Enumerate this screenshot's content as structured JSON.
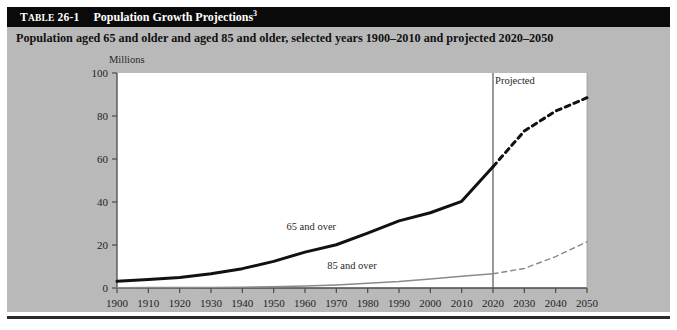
{
  "table": {
    "label_prefix": "T",
    "label_smallcaps": "ABLE",
    "label_number": " 26-1",
    "title": "Population Growth Projections",
    "title_footnote": "3",
    "subtitle": "Population aged 65 and older and aged 85 and older, selected years 1900–2010 and projected 2020–2050"
  },
  "chart_data": {
    "type": "line",
    "title": "Population Growth Projections",
    "subtitle": "Population aged 65 and older and aged 85 and older, selected years 1900–2010 and projected 2020–2050",
    "xlabel": "",
    "ylabel": "Millions",
    "y_unit_label": "Millions",
    "xlim": [
      1900,
      2050
    ],
    "ylim": [
      0,
      100
    ],
    "yticks": [
      0,
      20,
      40,
      60,
      80,
      100
    ],
    "xticks": [
      1900,
      1910,
      1920,
      1930,
      1940,
      1950,
      1960,
      1970,
      1980,
      1990,
      2000,
      2010,
      2020,
      2030,
      2040,
      2050
    ],
    "grid": false,
    "legend_position": "inline-annotations",
    "projection_divider_x": 2020,
    "projection_label": "Projected",
    "annotations": [
      {
        "text": "65 and over",
        "x": 1962,
        "y": 27
      },
      {
        "text": "85 and over",
        "x": 1975,
        "y": 9
      },
      {
        "text": "Projected",
        "x": 2027,
        "y": 95
      }
    ],
    "x": [
      1900,
      1910,
      1920,
      1930,
      1940,
      1950,
      1960,
      1970,
      1980,
      1990,
      2000,
      2010,
      2020,
      2030,
      2040,
      2050
    ],
    "series": [
      {
        "name": "65 and over",
        "style": "thick-black",
        "color": "#111111",
        "historical": {
          "x": [
            1900,
            1910,
            1920,
            1930,
            1940,
            1950,
            1960,
            1970,
            1980,
            1990,
            2000,
            2010,
            2020
          ],
          "values": [
            3.1,
            4.0,
            4.9,
            6.6,
            9.0,
            12.4,
            16.7,
            20.1,
            25.5,
            31.2,
            35.0,
            40.3,
            56.4
          ]
        },
        "projected": {
          "x": [
            2020,
            2030,
            2040,
            2050
          ],
          "values": [
            56.4,
            73.0,
            82.3,
            88.5
          ]
        }
      },
      {
        "name": "85 and over",
        "style": "thin-gray",
        "color": "#8a8a8a",
        "historical": {
          "x": [
            1900,
            1910,
            1920,
            1930,
            1940,
            1950,
            1960,
            1970,
            1980,
            1990,
            2000,
            2010,
            2020
          ],
          "values": [
            0.1,
            0.2,
            0.2,
            0.3,
            0.4,
            0.6,
            0.9,
            1.4,
            2.2,
            3.0,
            4.2,
            5.5,
            6.6
          ]
        },
        "projected": {
          "x": [
            2020,
            2030,
            2040,
            2050
          ],
          "values": [
            6.6,
            9.1,
            14.6,
            21.5
          ]
        }
      }
    ]
  }
}
